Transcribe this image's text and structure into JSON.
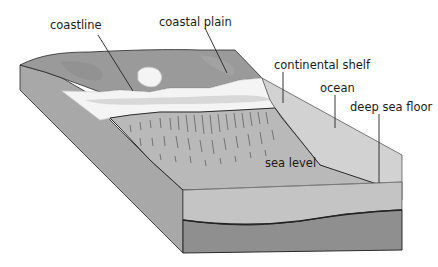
{
  "diagram": {
    "type": "block-diagram",
    "labels": {
      "coastline": "coastline",
      "coastal_plain": "coastal plain",
      "continental_shelf": "continental shelf",
      "ocean": "ocean",
      "deep_sea_floor": "deep sea floor",
      "sea_level": "sea level"
    },
    "colors": {
      "land_top": "#9a9a9a",
      "land_side_left": "#a8a8a8",
      "shelf_textured": "#b9b9b9",
      "beach_white": "#f4f4f4",
      "beach_grey_band": "#d8d8d8",
      "water": "#cfcfcf",
      "deep_block_front": "#8f8f8f",
      "upper_front_band": "#c4c4c4",
      "outline": "#2a2a2a"
    }
  }
}
